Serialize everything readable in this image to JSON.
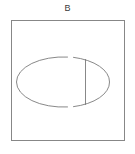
{
  "figure": {
    "label": "B",
    "label_position": {
      "x": 66,
      "y": 10
    },
    "background_color": "#ffffff",
    "stroke_color": "#7a7a7a",
    "stroke_width": 0.9,
    "canvas": {
      "width": 135,
      "height": 154
    }
  },
  "frame": {
    "name": "panel-border",
    "shape": "rectangle",
    "x": 11.5,
    "y": 20.5,
    "width": 113,
    "height": 120,
    "fill": "none",
    "stroke": "#7a7a7a"
  },
  "ellipse": {
    "name": "outer-ellipse",
    "shape": "ellipse",
    "cx": 63.0,
    "cy": 82.0,
    "rx": 46.5,
    "ry": 25.0,
    "fill": "none",
    "stroke": "#7a7a7a",
    "gap_top": {
      "x_start": 67.5,
      "x_end": 73.5,
      "y": 57.0
    },
    "gap_bottom": {
      "x_start": 67.5,
      "x_end": 73.5,
      "y": 107.0
    }
  },
  "chord": {
    "name": "vertical-chord",
    "shape": "line",
    "x": 85.5,
    "y_top": 59.5,
    "y_bottom": 104.5,
    "stroke": "#7a7a7a"
  },
  "segments": {
    "left_arc_label": "left-open-arc",
    "right_arc_label": "right-closed-arc"
  }
}
